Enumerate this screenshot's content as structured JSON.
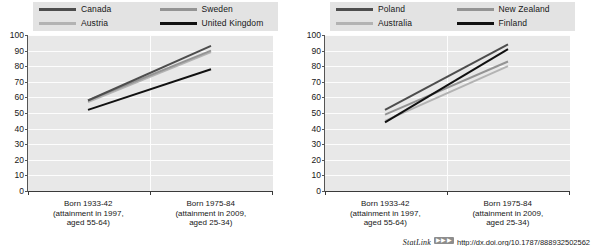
{
  "statlink": {
    "name": "StatLink",
    "badge": "▶▶▶",
    "url": "http://dx.doi.org/10.1787/888932502562"
  },
  "axis": {
    "y_ticks": [
      "100",
      "90",
      "80",
      "70",
      "60",
      "50",
      "40",
      "30",
      "20",
      "10",
      "0"
    ],
    "ylim": [
      0,
      100
    ],
    "x_categories": [
      "Born 1933-42\n(attainment in 1997,\naged 55-64)",
      "Born 1975-84\n(attainment in 2009,\naged 25-34)"
    ],
    "x_cat_1_line1": "Born 1933-42",
    "x_cat_1_line2": "(attainment in 1997,",
    "x_cat_1_line3": "aged 55-64)",
    "x_cat_2_line1": "Born 1975-84",
    "x_cat_2_line2": "(attainment in 2009,",
    "x_cat_2_line3": "aged 25-34)"
  },
  "colors": {
    "dark_gray": "#4d4d4d",
    "light_gray": "#b3b3b3",
    "mid_gray": "#949494",
    "black": "#111111",
    "plot_bg": "#e8e8e8",
    "legend_bg": "#e3e3e3",
    "gridline": "#fdfdfd"
  },
  "chart_data": [
    {
      "type": "line",
      "title": "",
      "xlabel": "",
      "ylabel": "",
      "ylim": [
        0,
        100
      ],
      "grid": true,
      "legend_position": "top",
      "categories": [
        "Born 1933-42 (attainment in 1997, aged 55-64)",
        "Born 1975-84 (attainment in 2009, aged 25-34)"
      ],
      "series": [
        {
          "name": "Canada",
          "values": [
            58,
            93
          ],
          "color": "#4d4d4d"
        },
        {
          "name": "Austria",
          "values": [
            57,
            89
          ],
          "color": "#b3b3b3"
        },
        {
          "name": "Sweden",
          "values": [
            58,
            90
          ],
          "color": "#949494"
        },
        {
          "name": "United Kingdom",
          "values": [
            52,
            78
          ],
          "color": "#111111"
        }
      ]
    },
    {
      "type": "line",
      "title": "",
      "xlabel": "",
      "ylabel": "",
      "ylim": [
        0,
        100
      ],
      "grid": true,
      "legend_position": "top",
      "categories": [
        "Born 1933-42 (attainment in 1997, aged 55-64)",
        "Born 1975-84 (attainment in 2009, aged 25-34)"
      ],
      "series": [
        {
          "name": "Poland",
          "values": [
            52,
            94
          ],
          "color": "#4d4d4d"
        },
        {
          "name": "Australia",
          "values": [
            45,
            80
          ],
          "color": "#b3b3b3"
        },
        {
          "name": "New Zealand",
          "values": [
            49,
            83
          ],
          "color": "#949494"
        },
        {
          "name": "Finland",
          "values": [
            44,
            91
          ],
          "color": "#111111"
        }
      ]
    }
  ],
  "panels": [
    {
      "legend": [
        {
          "label": "Canada",
          "color": "#4d4d4d"
        },
        {
          "label": "Sweden",
          "color": "#949494"
        },
        {
          "label": "Austria",
          "color": "#b3b3b3"
        },
        {
          "label": "United Kingdom",
          "color": "#111111"
        }
      ]
    },
    {
      "legend": [
        {
          "label": "Poland",
          "color": "#4d4d4d"
        },
        {
          "label": "New Zealand",
          "color": "#949494"
        },
        {
          "label": "Australia",
          "color": "#b3b3b3"
        },
        {
          "label": "Finland",
          "color": "#111111"
        }
      ]
    }
  ]
}
